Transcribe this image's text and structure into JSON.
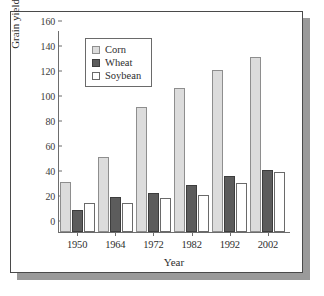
{
  "chart_data": {
    "type": "bar",
    "title": "",
    "xlabel": "Year",
    "ylabel": "Grain yield (bu/ac)",
    "categories": [
      "1950",
      "1964",
      "1972",
      "1982",
      "1992",
      "2002"
    ],
    "series": [
      {
        "name": "Corn",
        "color": "#dcdcdc",
        "values": [
          40,
          60,
          100,
          115,
          130,
          140
        ]
      },
      {
        "name": "Wheat",
        "color": "#5c5c5c",
        "values": [
          18,
          28,
          31,
          38,
          45,
          50
        ]
      },
      {
        "name": "Soybean",
        "color": "#ffffff",
        "values": [
          23,
          23,
          27,
          30,
          39,
          48
        ]
      }
    ],
    "ylim": [
      0,
      160
    ],
    "yticks": [
      0,
      20,
      40,
      60,
      80,
      100,
      120,
      140,
      160
    ],
    "ytick_labels": [
      "0",
      "20",
      "40",
      "60",
      "80",
      "100",
      "120",
      "140",
      "160"
    ],
    "grid": false,
    "legend_position": "top-left"
  },
  "colors": {
    "axis": "#6d6d6d",
    "frame": "#4a4a4a",
    "shadow": "#9a9a9a",
    "text": "#2e2e2e"
  }
}
